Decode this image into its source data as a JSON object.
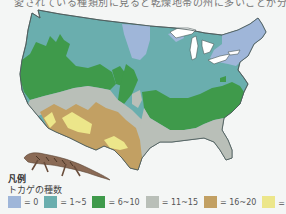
{
  "caption_fragment": "愛されている種類別に見ると乾燥地帯の州に多いことが分かる",
  "map": {
    "region": "Contiguous United States",
    "subject": "Number of lizard species"
  },
  "legend": {
    "title": "凡例",
    "subtitle": "トカゲの種数",
    "items": [
      {
        "label": "= 0",
        "color": "#9fb6d9"
      },
      {
        "label": "= 1~5",
        "color": "#6aaeae"
      },
      {
        "label": "= 6~10",
        "color": "#3f9a4b"
      },
      {
        "label": "= 11~15",
        "color": "#b9bfb8"
      },
      {
        "label": "= 16~20",
        "color": "#c2a063"
      },
      {
        "label": "= 20以上",
        "color": "#ece68a"
      }
    ]
  },
  "colors": {
    "zero": "#9fb6d9",
    "low": "#6aaeae",
    "mid": "#3f9a4b",
    "midhigh": "#b9bfb8",
    "high": "#c2a063",
    "highest": "#ece68a",
    "water": "#ffffff",
    "border": "#4b5a5a"
  }
}
